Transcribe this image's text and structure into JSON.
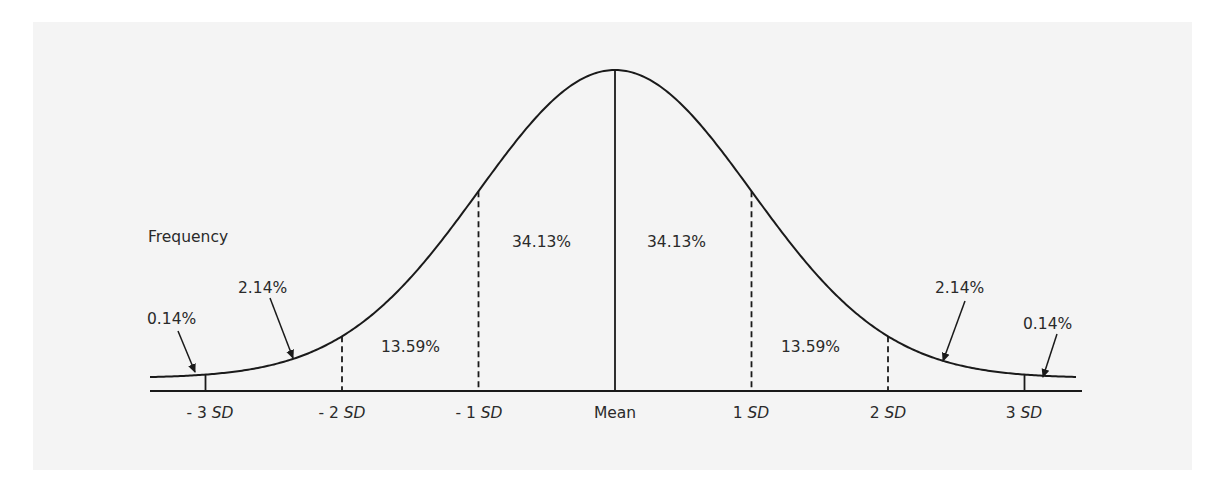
{
  "diagram": {
    "y_axis_label": "Frequency",
    "x_axis_ticks": [
      {
        "prefix": "- 3 ",
        "unit": "SD",
        "z": -3
      },
      {
        "prefix": "- 2 ",
        "unit": "SD",
        "z": -2
      },
      {
        "prefix": "- 1 ",
        "unit": "SD",
        "z": -1
      },
      {
        "prefix": "Mean",
        "unit": "",
        "z": 0
      },
      {
        "prefix": "1 ",
        "unit": "SD",
        "z": 1
      },
      {
        "prefix": "2 ",
        "unit": "SD",
        "z": 2
      },
      {
        "prefix": "3 ",
        "unit": "SD",
        "z": 3
      }
    ],
    "regions": [
      {
        "label": "0.14%",
        "from": "-inf",
        "to": -3,
        "arrow": true
      },
      {
        "label": "2.14%",
        "from": -3,
        "to": -2,
        "arrow": true
      },
      {
        "label": "13.59%",
        "from": -2,
        "to": -1,
        "arrow": false
      },
      {
        "label": "34.13%",
        "from": -1,
        "to": 0,
        "arrow": false
      },
      {
        "label": "34.13%",
        "from": 0,
        "to": 1,
        "arrow": false
      },
      {
        "label": "13.59%",
        "from": 1,
        "to": 2,
        "arrow": false
      },
      {
        "label": "2.14%",
        "from": 2,
        "to": 3,
        "arrow": true
      },
      {
        "label": "0.14%",
        "from": 3,
        "to": "inf",
        "arrow": true
      }
    ],
    "colors": {
      "line": "#1a1a1a",
      "text": "#2a2a2a",
      "background": "#f4f4f4"
    }
  }
}
